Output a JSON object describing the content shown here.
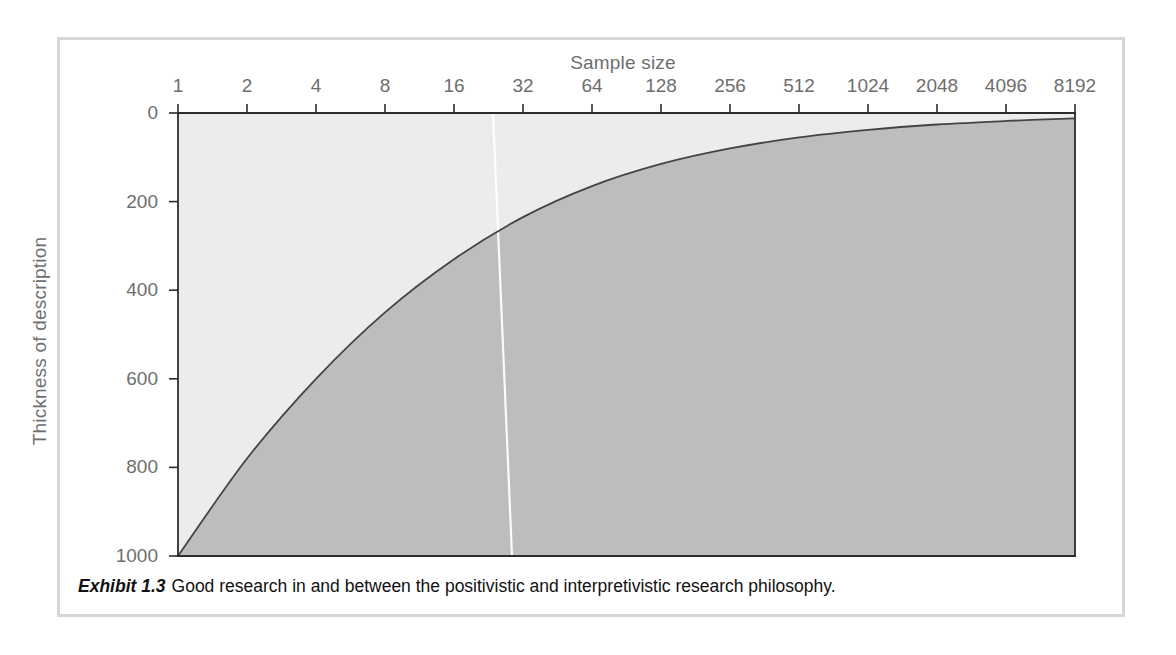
{
  "figure": {
    "caption_label": "Exhibit 1.3",
    "caption_text": "Good research in and between the positivistic and interpretivistic research philosophy.",
    "frame_color": "#d6d6d6"
  },
  "chart_data": {
    "type": "area",
    "title": "Sample size",
    "xlabel": "Sample size",
    "ylabel": "Thickness of description",
    "x_scale": "log2",
    "xlim": [
      1,
      8192
    ],
    "ylim": [
      0,
      1000
    ],
    "y_inverted": true,
    "grid": false,
    "legend": "none",
    "x_tick_labels": [
      "1",
      "2",
      "4",
      "8",
      "16",
      "32",
      "64",
      "128",
      "256",
      "512",
      "1024",
      "2048",
      "4096",
      "8192"
    ],
    "x_tick_values": [
      1,
      2,
      4,
      8,
      16,
      32,
      64,
      128,
      256,
      512,
      1024,
      2048,
      4096,
      8192
    ],
    "y_tick_labels": [
      "0",
      "200",
      "400",
      "600",
      "800",
      "1000"
    ],
    "y_tick_values": [
      0,
      200,
      400,
      600,
      800,
      1000
    ],
    "series": [
      {
        "name": "Thickness of description",
        "x": [
          1,
          2,
          4,
          8,
          16,
          32,
          64,
          128,
          256,
          512,
          1024,
          2048,
          4096,
          8192
        ],
        "values": [
          1000,
          780,
          600,
          450,
          330,
          235,
          165,
          115,
          80,
          55,
          38,
          26,
          18,
          12
        ]
      }
    ],
    "regions": [
      {
        "name": "interpretivistic-region",
        "position": "above-curve",
        "color": "#ececec"
      },
      {
        "name": "positivistic-region",
        "position": "below-curve",
        "color": "#bcbcbc"
      }
    ],
    "annotations": [
      {
        "name": "divider-line",
        "label": "",
        "x_top": 30,
        "x_bottom": 34,
        "color": "#ffffff"
      }
    ],
    "curve_color": "#444444"
  }
}
